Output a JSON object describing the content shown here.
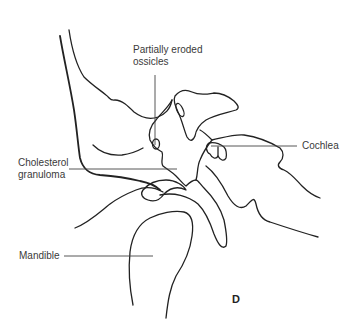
{
  "diagram": {
    "panel_letter": "D",
    "labels": [
      {
        "id": "partially-eroded-ossicles",
        "lines": [
          "Partially eroded",
          "ossicles"
        ]
      },
      {
        "id": "cochlea",
        "lines": [
          "Cochlea"
        ]
      },
      {
        "id": "cholesterol-granuloma",
        "lines": [
          "Cholesterol",
          "granuloma"
        ]
      },
      {
        "id": "mandible",
        "lines": [
          "Mandible"
        ]
      }
    ]
  },
  "colors": {
    "line": "#222222",
    "text": "#3a3a3a",
    "background": "#ffffff"
  }
}
